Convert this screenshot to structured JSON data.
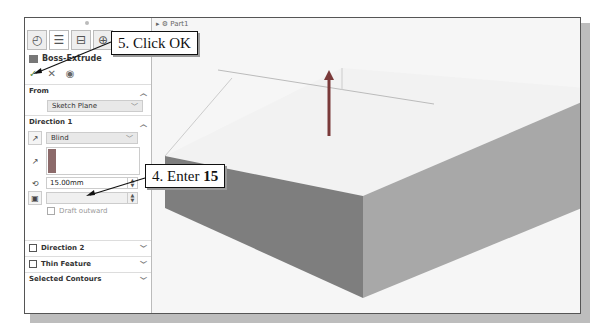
{
  "panel": {
    "tabs": [
      {
        "icon": "feature-manager-icon",
        "glyph": "◴"
      },
      {
        "icon": "property-manager-icon",
        "glyph": "☰"
      },
      {
        "icon": "configuration-manager-icon",
        "glyph": "⊟"
      },
      {
        "icon": "dimxpert-icon",
        "glyph": "⊕"
      }
    ],
    "feature_title": "Boss-Extrude",
    "actions": {
      "ok": "✓",
      "cancel": "✕",
      "preview": "◉"
    },
    "from": {
      "label": "From",
      "value": "Sketch Plane"
    },
    "direction1": {
      "label": "Direction 1",
      "end_condition": "Blind",
      "depth": "15.00mm",
      "draft_outward": "Draft outward"
    },
    "direction2": {
      "label": "Direction 2"
    },
    "thin_feature": {
      "label": "Thin Feature"
    },
    "selected_contours": {
      "label": "Selected Contours"
    }
  },
  "viewport": {
    "tree_label": "Part1"
  },
  "callouts": {
    "click_ok": "5. Click OK",
    "enter_prefix": "4. Enter ",
    "enter_value": "15"
  }
}
